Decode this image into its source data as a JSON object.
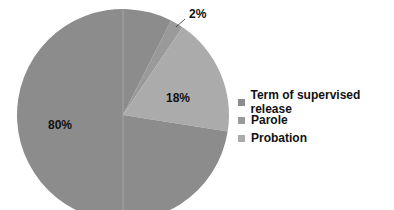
{
  "chart_data": {
    "type": "pie",
    "title": "",
    "categories": [
      "Term of supervised release",
      "Parole",
      "Probation"
    ],
    "values": [
      80,
      2,
      18
    ],
    "labels": [
      "80%",
      "2%",
      "18%"
    ],
    "colors": [
      "#8c8c8c",
      "#9a9a9a",
      "#ababab"
    ],
    "legend_position": "right"
  },
  "legend": {
    "items": [
      {
        "label": "Term of supervised release",
        "color": "#8c8c8c"
      },
      {
        "label": "Parole",
        "color": "#9a9a9a"
      },
      {
        "label": "Probation",
        "color": "#ababab"
      }
    ]
  },
  "slice_labels": {
    "supervised": "80%",
    "parole": "2%",
    "probation": "18%"
  }
}
